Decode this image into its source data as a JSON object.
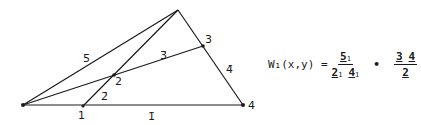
{
  "diagram": {
    "points": {
      "A": {
        "x": 23,
        "y": 105
      },
      "T": {
        "x": 178,
        "y": 10
      },
      "P1": {
        "x": 83,
        "y": 106
      },
      "P2": {
        "x": 114,
        "y": 75
      },
      "P3": {
        "x": 203,
        "y": 46
      },
      "P4": {
        "x": 243,
        "y": 105
      }
    },
    "vertex_labels": {
      "p1": "1",
      "p2": "2",
      "p3": "3",
      "p4": "4"
    },
    "edge_labels": {
      "e1": "1̄",
      "e2": "2̄",
      "e3": "3̄",
      "e4": "4̄",
      "e5": "5̄"
    },
    "stroke_color": "#1a1a1a"
  },
  "formula": {
    "lhs": "W₁(x,y) =",
    "num_main": "5",
    "num_sub": "1",
    "den1_main": "2",
    "den1_sub": "1",
    "den2_main": "4",
    "den2_sub": "1",
    "operator": "•",
    "num2_a": "3",
    "num2_b": "4",
    "den3": "2"
  }
}
